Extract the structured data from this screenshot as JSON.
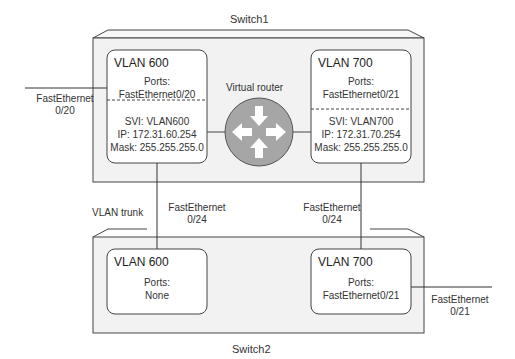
{
  "switch1": {
    "label": "Switch1",
    "vlan_left": {
      "title": "VLAN 600",
      "ports_label": "Ports:",
      "ports": "FastEthernet0/20",
      "svi": "SVI: VLAN600",
      "ip": "IP: 172.31.60.254",
      "mask": "Mask: 255.255.255.0"
    },
    "vlan_right": {
      "title": "VLAN 700",
      "ports_label": "Ports:",
      "ports": "FastEthernet0/21",
      "svi": "SVI: VLAN700",
      "ip": "IP: 172.31.70.254",
      "mask": "Mask: 255.255.255.0"
    },
    "router_label": "Virtual router"
  },
  "switch2": {
    "label": "Switch2",
    "vlan_left": {
      "title": "VLAN 600",
      "ports_label": "Ports:",
      "ports": "None"
    },
    "vlan_right": {
      "title": "VLAN 700",
      "ports_label": "Ports:",
      "ports": "FastEthernet0/21"
    }
  },
  "links": {
    "sw1_left_port": {
      "line1": "FastEthernet",
      "line2": "0/20"
    },
    "trunk_label": "VLAN trunk",
    "trunk_left_port": {
      "line1": "FastEthernet",
      "line2": "0/24"
    },
    "trunk_right_port": {
      "line1": "FastEthernet",
      "line2": "0/24"
    },
    "sw2_right_port": {
      "line1": "FastEthernet",
      "line2": "0/21"
    }
  },
  "colors": {
    "switch_fill": "#f2f2f2",
    "router_fill": "#a6a6a6",
    "line": "#333333"
  }
}
